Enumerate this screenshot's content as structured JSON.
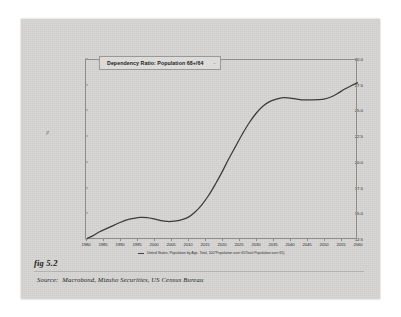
{
  "figure": {
    "fig_label": "fig 5.2",
    "source_keyword": "Source:",
    "source_text": "Macrobond, Mizuho Securities, US Census Bureau"
  },
  "chart_data": {
    "type": "line",
    "title": "Dependency Ratio: Population 68+/64",
    "title_tail": "-",
    "xlabel": "",
    "ylabel": "%",
    "grid": false,
    "legend_position": "bottom",
    "xlim": [
      1980,
      2060
    ],
    "ylim": [
      12.5,
      30.0
    ],
    "xticks": [
      "1980",
      "1985",
      "1990",
      "1995",
      "2000",
      "2005",
      "2010",
      "2015",
      "2020",
      "2025",
      "2030",
      "2035",
      "2040",
      "2045",
      "2050",
      "2055",
      "2060"
    ],
    "yticks": [
      "30.0",
      "27.5",
      "25.0",
      "22.5",
      "20.0",
      "17.5",
      "15.0",
      "12.5"
    ],
    "series": [
      {
        "name": "United States, Population by Age, Total, 100*Population over 65/Total Population over 65)",
        "color": "#3b3b3a",
        "x": [
          1980,
          1982,
          1984,
          1986,
          1988,
          1990,
          1992,
          1994,
          1996,
          1998,
          2000,
          2002,
          2004,
          2006,
          2008,
          2010,
          2012,
          2014,
          2016,
          2018,
          2020,
          2022,
          2024,
          2026,
          2028,
          2030,
          2032,
          2034,
          2036,
          2038,
          2040,
          2042,
          2044,
          2046,
          2048,
          2050,
          2052,
          2054,
          2056,
          2058,
          2060
        ],
        "values": [
          12.6,
          12.9,
          13.3,
          13.6,
          13.9,
          14.2,
          14.45,
          14.6,
          14.7,
          14.68,
          14.55,
          14.38,
          14.3,
          14.33,
          14.45,
          14.7,
          15.2,
          15.9,
          16.8,
          17.9,
          19.1,
          20.4,
          21.6,
          22.8,
          23.9,
          24.8,
          25.5,
          25.95,
          26.2,
          26.35,
          26.3,
          26.2,
          26.12,
          26.12,
          26.15,
          26.2,
          26.4,
          26.75,
          27.15,
          27.5,
          27.8
        ]
      }
    ]
  }
}
